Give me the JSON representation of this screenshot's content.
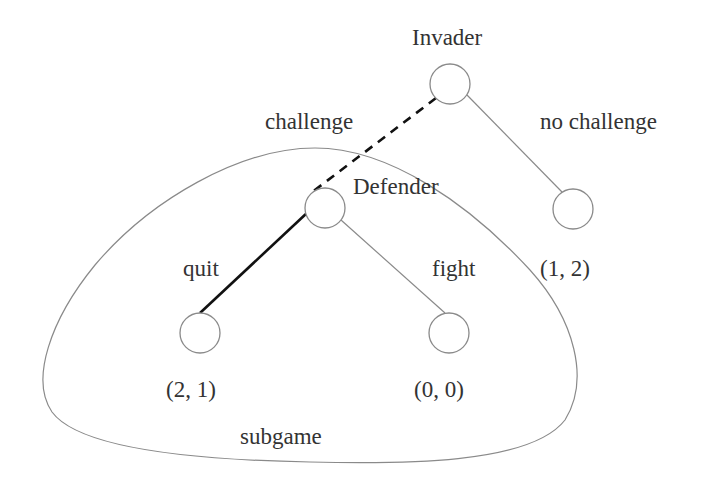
{
  "diagram": {
    "type": "game-tree",
    "colors": {
      "node_stroke": "#8a8a8a",
      "edge_thin": "#8a8a8a",
      "edge_thick": "#111111",
      "outline": "#8a8a8a",
      "text": "#333333"
    },
    "players": {
      "root": "Invader",
      "second": "Defender"
    },
    "actions": {
      "challenge": "challenge",
      "no_challenge": "no challenge",
      "quit": "quit",
      "fight": "fight"
    },
    "payoffs": {
      "no_challenge": "(1, 2)",
      "quit": "(2, 1)",
      "fight": "(0, 0)"
    },
    "region_label": "subgame",
    "nodes": [
      {
        "id": "invader",
        "cx": 450,
        "cy": 84,
        "r": 20
      },
      {
        "id": "defender",
        "cx": 325,
        "cy": 208,
        "r": 20
      },
      {
        "id": "no-challenge-leaf",
        "cx": 573,
        "cy": 209,
        "r": 20
      },
      {
        "id": "quit-leaf",
        "cx": 200,
        "cy": 333,
        "r": 20
      },
      {
        "id": "fight-leaf",
        "cx": 449,
        "cy": 333,
        "r": 20
      }
    ],
    "edges": [
      {
        "from": "invader",
        "to": "defender",
        "style": "dashed-thick"
      },
      {
        "from": "invader",
        "to": "no-challenge-leaf",
        "style": "thin"
      },
      {
        "from": "defender",
        "to": "quit-leaf",
        "style": "solid-thick"
      },
      {
        "from": "defender",
        "to": "fight-leaf",
        "style": "thin"
      }
    ]
  }
}
